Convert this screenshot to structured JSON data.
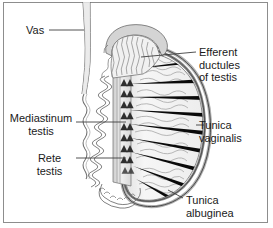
{
  "figure": {
    "kind": "anatomical-diagram",
    "frame_border_color": "#8d8d8d",
    "background_color": "#ffffff"
  },
  "labels": {
    "vas": "Vas",
    "efferent_ductules": "Efferent\nductules\nof testis",
    "mediastinum_testis": "Mediastinum\ntestis",
    "rete_testis": "Rete\ntestis",
    "tunica_vaginalis": "Tunica\nvaginalis",
    "tunica_albuginea": "Tunica\nalbuginea"
  },
  "structures": [
    {
      "name": "vas-deferens",
      "description": "vertical duct descending from top of figure"
    },
    {
      "name": "epididymis-head",
      "description": "convoluted cap over superior pole of testis"
    },
    {
      "name": "epididymis-body-tail",
      "description": "coiled duct along posterior border, looping below testis"
    },
    {
      "name": "testis-body",
      "description": "ovoid organ with radiating lobules"
    },
    {
      "name": "septa-testis",
      "description": "black radiating wedges dividing the lobules"
    },
    {
      "name": "seminiferous-tubules",
      "description": "wavy grey lines filling each lobule"
    },
    {
      "name": "rete-testis",
      "description": "column of dark triangles within the mediastinum"
    },
    {
      "name": "mediastinum-testis",
      "description": "pale vertical band at posterior border"
    },
    {
      "name": "tunica-albuginea",
      "description": "inner capsule layer of the testis"
    },
    {
      "name": "tunica-vaginalis",
      "description": "outer serous layer surrounding the testis"
    }
  ],
  "colors": {
    "ink": "#1a1a1a",
    "outline": "#555555",
    "tissue_fill": "#f2f2f2",
    "tissue_fill_dark": "#dcdcdc",
    "septa": "#0a0a0a",
    "tubules": "#9a9a9a",
    "leader": "#4d4d4d"
  }
}
